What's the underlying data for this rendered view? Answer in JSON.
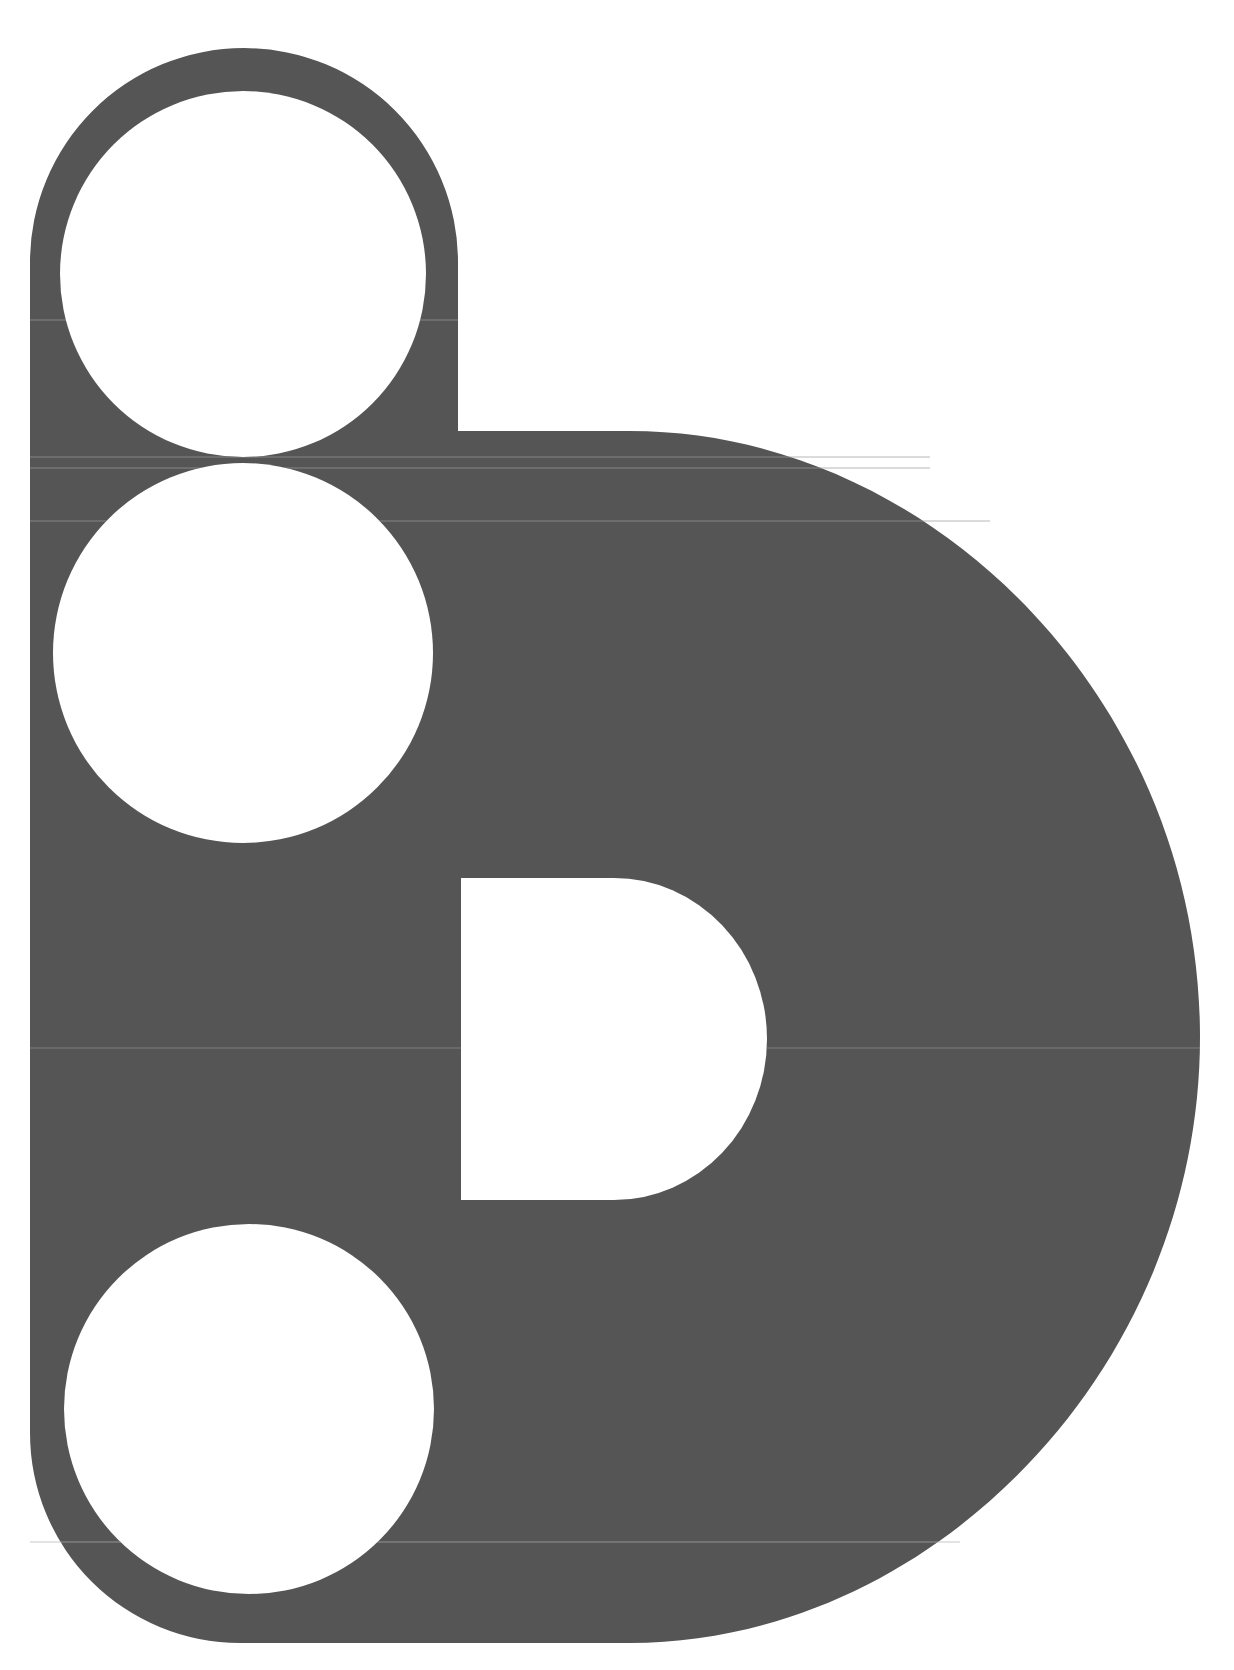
{
  "logo": {
    "description": "Stylized letter D/b mark with three white circular cutouts and a D-shaped counter",
    "colors": {
      "shape_fill": "#555555",
      "background": "#ffffff",
      "cutout": "#ffffff",
      "scanline": "#8a8a8a"
    },
    "geometry": {
      "outer_left_x": 30,
      "outer_right_x": 1200,
      "top_y": 48,
      "bottom_y": 1643,
      "stem_right_x": 458,
      "bowl_top_y": 431,
      "circles": [
        {
          "cx": 243,
          "cy": 274,
          "r": 183
        },
        {
          "cx": 243,
          "cy": 653,
          "r": 190
        },
        {
          "cx": 249,
          "cy": 1409,
          "r": 185
        }
      ],
      "counter": {
        "x": 461,
        "y": 878,
        "w": 153,
        "h": 322
      }
    }
  }
}
